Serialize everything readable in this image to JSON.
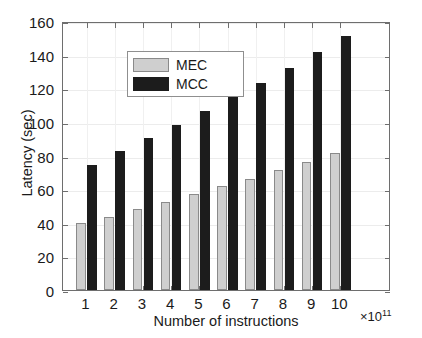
{
  "chart_data": {
    "type": "bar",
    "title": "",
    "xlabel": "Number of instructions",
    "ylabel": "Latency (sec)",
    "x_exponent_label": "×10",
    "x_exponent_value": "11",
    "categories": [
      "1",
      "2",
      "3",
      "4",
      "5",
      "6",
      "7",
      "8",
      "9",
      "10"
    ],
    "series": [
      {
        "name": "MEC",
        "color": "#cfcfcf",
        "values": [
          39.7,
          43.6,
          48.2,
          52.6,
          57.0,
          61.7,
          66.3,
          71.2,
          75.9,
          81.5
        ]
      },
      {
        "name": "MCC",
        "color": "#1c1c1c",
        "values": [
          74.3,
          82.5,
          90.2,
          98.2,
          106.4,
          114.7,
          123.3,
          132.2,
          141.4,
          151.0
        ]
      }
    ],
    "ylim": [
      0,
      160
    ],
    "yticks": [
      0,
      20,
      40,
      60,
      80,
      100,
      120,
      140,
      160
    ],
    "ytick_labels": [
      "0",
      "20",
      "40",
      "60",
      "80",
      "100",
      "120",
      "140",
      "160"
    ],
    "grid": true,
    "legend_position": "top-left",
    "legend_entries": [
      "MEC",
      "MCC"
    ]
  },
  "legend": {
    "entries": [
      {
        "label": "MEC",
        "swatch": "mec"
      },
      {
        "label": "MCC",
        "swatch": "mcc"
      }
    ]
  },
  "axes": {
    "x_title": "Number of instructions",
    "y_title": "Latency (sec)",
    "exponent_prefix": "×10",
    "exponent_power": "11"
  }
}
